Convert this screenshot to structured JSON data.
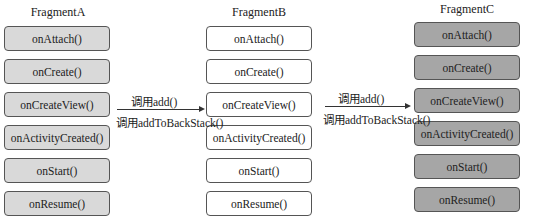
{
  "fragments": [
    {
      "title": "FragmentA",
      "style": "light",
      "methods": [
        "onAttach()",
        "onCreate()",
        "onCreateView()",
        "onActivityCreated()",
        "onStart()",
        "onResume()"
      ]
    },
    {
      "title": "FragmentB",
      "style": "white",
      "methods": [
        "onAttach()",
        "onCreate()",
        "onCreateView()",
        "onActivityCreated()",
        "onStart()",
        "onResume()"
      ]
    },
    {
      "title": "FragmentC",
      "style": "dark",
      "methods": [
        "onAttach()",
        "onCreate()",
        "onCreateView()",
        "onActivityCreated()",
        "onStart()",
        "onResume()"
      ]
    }
  ],
  "arrows": [
    {
      "top_label": "调用add()",
      "bottom_label": "调用addToBackStack()"
    },
    {
      "top_label": "调用add()",
      "bottom_label": "调用addToBackStack()"
    }
  ],
  "colors": {
    "light": "#d9d9d9",
    "white": "#ffffff",
    "dark": "#a6a6a6",
    "border": "#555555"
  }
}
